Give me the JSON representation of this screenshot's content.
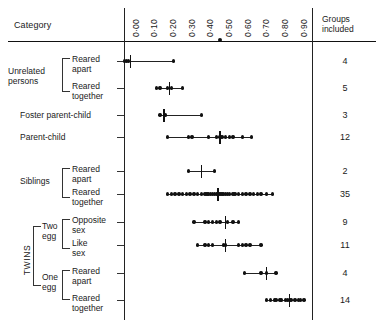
{
  "header": {
    "category_label": "Category",
    "groups_label_line1": "Groups",
    "groups_label_line2": "included"
  },
  "chart_data": {
    "type": "scatter",
    "title": "",
    "xlabel": "",
    "ylabel": "Category",
    "xlim": [
      0.0,
      1.0
    ],
    "grid": false,
    "legend": false,
    "axis_tick_labels": [
      "0·00",
      "0·10",
      "0·20",
      "0·30",
      "0·40",
      "0·50",
      "0·60",
      "0·70",
      "0·80",
      "0·90"
    ],
    "axis_tick_values": [
      0.0,
      0.1,
      0.2,
      0.3,
      0.4,
      0.5,
      0.6,
      0.7,
      0.8,
      0.9
    ],
    "top_rule_marker": 0.5,
    "groups_column_header": "Groups included",
    "categories": [
      {
        "group": "Unrelated persons",
        "label_line1": "Reared",
        "label_line2": "apart",
        "groups_included": 4,
        "range": [
          0.0,
          0.25
        ],
        "mean": 0.02,
        "values": [
          -0.01,
          0.0,
          0.01,
          0.25
        ]
      },
      {
        "group": "Unrelated persons",
        "label_line1": "Reared",
        "label_line2": "together",
        "groups_included": 5,
        "range": [
          0.16,
          0.3
        ],
        "mean": 0.23,
        "values": [
          0.16,
          0.18,
          0.22,
          0.24,
          0.3
        ]
      },
      {
        "group": "",
        "label_line1": "Foster parent-child",
        "label_line2": "",
        "groups_included": 3,
        "range": [
          0.18,
          0.4
        ],
        "mean": 0.2,
        "values": [
          0.18,
          0.21,
          0.4
        ]
      },
      {
        "group": "",
        "label_line1": "Parent-child",
        "label_line2": "",
        "groups_included": 12,
        "range": [
          0.22,
          0.67
        ],
        "mean": 0.5,
        "values": [
          0.22,
          0.33,
          0.35,
          0.44,
          0.48,
          0.5,
          0.51,
          0.53,
          0.55,
          0.57,
          0.62,
          0.67
        ]
      },
      {
        "group": "Siblings",
        "label_line1": "Reared",
        "label_line2": "apart",
        "groups_included": 2,
        "range": [
          0.33,
          0.47
        ],
        "mean": 0.4,
        "values": [
          0.33,
          0.47
        ]
      },
      {
        "group": "Siblings",
        "label_line1": "Reared",
        "label_line2": "together",
        "groups_included": 35,
        "range": [
          0.22,
          0.78
        ],
        "mean": 0.49,
        "values": [
          0.22,
          0.24,
          0.26,
          0.28,
          0.3,
          0.32,
          0.34,
          0.36,
          0.38,
          0.4,
          0.42,
          0.43,
          0.44,
          0.45,
          0.46,
          0.47,
          0.48,
          0.49,
          0.5,
          0.51,
          0.52,
          0.53,
          0.54,
          0.55,
          0.57,
          0.58,
          0.6,
          0.62,
          0.64,
          0.66,
          0.68,
          0.7,
          0.72,
          0.75,
          0.78
        ]
      },
      {
        "group": "Two egg",
        "label_line1": "Opposite",
        "label_line2": "sex",
        "groups_included": 9,
        "range": [
          0.36,
          0.6
        ],
        "mean": 0.53,
        "values": [
          0.36,
          0.42,
          0.44,
          0.46,
          0.48,
          0.5,
          0.54,
          0.57,
          0.6
        ]
      },
      {
        "group": "Two egg",
        "label_line1": "Like",
        "label_line2": "sex",
        "groups_included": 11,
        "range": [
          0.38,
          0.72
        ],
        "mean": 0.53,
        "values": [
          0.38,
          0.42,
          0.44,
          0.46,
          0.52,
          0.53,
          0.6,
          0.62,
          0.64,
          0.66,
          0.72
        ]
      },
      {
        "group": "One egg",
        "label_line1": "Reared",
        "label_line2": "apart",
        "groups_included": 4,
        "range": [
          0.63,
          0.8
        ],
        "mean": 0.75,
        "values": [
          0.63,
          0.72,
          0.75,
          0.8
        ]
      },
      {
        "group": "One egg",
        "label_line1": "Reared",
        "label_line2": "together",
        "groups_included": 14,
        "range": [
          0.75,
          0.95
        ],
        "mean": 0.87,
        "values": [
          0.75,
          0.77,
          0.79,
          0.8,
          0.82,
          0.83,
          0.85,
          0.86,
          0.87,
          0.88,
          0.9,
          0.92,
          0.93,
          0.95
        ]
      }
    ],
    "group_labels": {
      "unrelated": "Unrelated\npersons",
      "siblings": "Siblings",
      "twins": "TWINS",
      "two_egg": "Two\negg",
      "one_egg": "One\negg"
    }
  }
}
